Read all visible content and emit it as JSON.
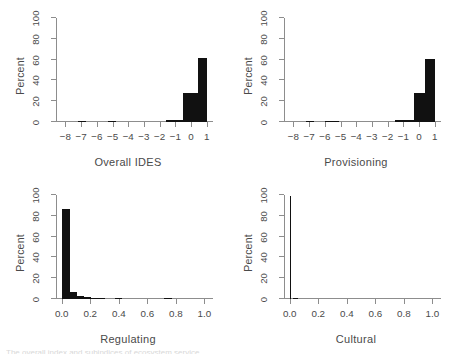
{
  "figure": {
    "background": "#ffffff",
    "bar_color": "#111111",
    "axis_color": "#8d8d8d",
    "ylabel": "Percent",
    "clipped_caption": "The overall index and subindices of ecosystem service"
  },
  "chart_data": [
    {
      "type": "bar",
      "title": "",
      "xlabel": "Overall IDES",
      "ylabel": "Percent",
      "xlim": [
        -8.6,
        1.4
      ],
      "ylim": [
        0,
        100
      ],
      "xticks": [
        -8,
        -7,
        -6,
        -5,
        -4,
        -3,
        -2,
        -1,
        0,
        1
      ],
      "xticklabels": [
        "−8",
        "−7",
        "−6",
        "−5",
        "−4",
        "−3",
        "−2",
        "−1",
        "0",
        "1"
      ],
      "yticks": [
        0,
        20,
        40,
        60,
        80,
        100
      ],
      "yticklabels": [
        "0",
        "20",
        "40",
        "60",
        "80",
        "100"
      ],
      "grid": false,
      "legend": "none",
      "bins": [
        {
          "x0": -7.2,
          "x1": -6.7,
          "value": 0.5
        },
        {
          "x0": -5.3,
          "x1": -4.8,
          "value": 0.5
        },
        {
          "x0": -1.6,
          "x1": -0.5,
          "value": 2.0
        },
        {
          "x0": -0.5,
          "x1": 0.45,
          "value": 27.5
        },
        {
          "x0": 0.45,
          "x1": 1.0,
          "value": 62.0
        }
      ]
    },
    {
      "type": "bar",
      "title": "",
      "xlabel": "Provisioning",
      "ylabel": "Percent",
      "xlim": [
        -8.6,
        1.4
      ],
      "ylim": [
        0,
        100
      ],
      "xticks": [
        -8,
        -7,
        -6,
        -5,
        -4,
        -3,
        -2,
        -1,
        0,
        1
      ],
      "xticklabels": [
        "−8",
        "−7",
        "−6",
        "−5",
        "−4",
        "−3",
        "−2",
        "−1",
        "0",
        "1"
      ],
      "yticks": [
        0,
        20,
        40,
        60,
        80,
        100
      ],
      "yticklabels": [
        "0",
        "20",
        "40",
        "60",
        "80",
        "100"
      ],
      "grid": false,
      "legend": "none",
      "bins": [
        {
          "x0": -7.2,
          "x1": -6.7,
          "value": 0.5
        },
        {
          "x0": -6.0,
          "x1": -5.1,
          "value": 0.5
        },
        {
          "x0": -1.5,
          "x1": -0.35,
          "value": 2.2
        },
        {
          "x0": -0.35,
          "x1": 0.4,
          "value": 28.0
        },
        {
          "x0": 0.4,
          "x1": 1.0,
          "value": 61.0
        }
      ]
    },
    {
      "type": "bar",
      "title": "",
      "xlabel": "Regulating",
      "ylabel": "Percent",
      "xlim": [
        -0.04,
        1.06
      ],
      "ylim": [
        0,
        100
      ],
      "xticks": [
        0.0,
        0.2,
        0.4,
        0.6,
        0.8,
        1.0
      ],
      "xticklabels": [
        "0.0",
        "0.2",
        "0.4",
        "0.6",
        "0.8",
        "1.0"
      ],
      "yticks": [
        0,
        20,
        40,
        60,
        80,
        100
      ],
      "yticklabels": [
        "0",
        "20",
        "40",
        "60",
        "80",
        "100"
      ],
      "grid": false,
      "legend": "none",
      "bins": [
        {
          "x0": 0.005,
          "x1": 0.055,
          "value": 87.0
        },
        {
          "x0": 0.055,
          "x1": 0.105,
          "value": 6.5
        },
        {
          "x0": 0.105,
          "x1": 0.155,
          "value": 3.0
        },
        {
          "x0": 0.155,
          "x1": 0.205,
          "value": 1.6
        },
        {
          "x0": 0.205,
          "x1": 0.255,
          "value": 0.9
        },
        {
          "x0": 0.255,
          "x1": 0.305,
          "value": 0.5
        },
        {
          "x0": 0.375,
          "x1": 0.425,
          "value": 0.7
        },
        {
          "x0": 0.72,
          "x1": 0.77,
          "value": 0.6
        }
      ]
    },
    {
      "type": "bar",
      "title": "",
      "xlabel": "Cultural",
      "ylabel": "Percent",
      "xlim": [
        -0.04,
        1.06
      ],
      "ylim": [
        0,
        100
      ],
      "xticks": [
        0.0,
        0.2,
        0.4,
        0.6,
        0.8,
        1.0
      ],
      "xticklabels": [
        "0.0",
        "0.2",
        "0.4",
        "0.6",
        "0.8",
        "1.0"
      ],
      "yticks": [
        0,
        20,
        40,
        60,
        80,
        100
      ],
      "yticklabels": [
        "0",
        "20",
        "40",
        "60",
        "80",
        "100"
      ],
      "grid": false,
      "legend": "none",
      "bins": [
        {
          "x0": 0.0,
          "x1": 0.012,
          "value": 99.5
        },
        {
          "x0": 0.02,
          "x1": 0.06,
          "value": 0.4
        }
      ]
    }
  ]
}
